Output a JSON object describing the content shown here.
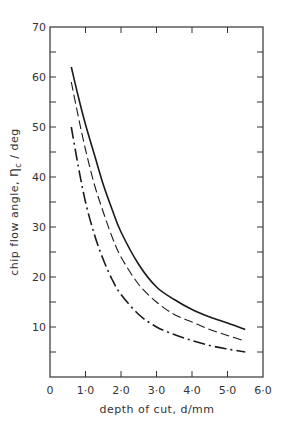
{
  "chart_data": {
    "type": "line",
    "title": "",
    "xlabel": "depth of cut, d/mm",
    "ylabel": "chip flow angle, ηc / deg",
    "ylabel_parts": {
      "prefix": "chip flow angle, ",
      "symbol": "η",
      "subscript": "c",
      "suffix": " / deg"
    },
    "xlim": [
      0,
      6.0
    ],
    "ylim": [
      0,
      70
    ],
    "x_ticks": [
      "0",
      "1·0",
      "2·0",
      "3·0",
      "4·0",
      "5·0",
      "6·0"
    ],
    "y_ticks": [
      "10",
      "20",
      "30",
      "40",
      "50",
      "60",
      "70"
    ],
    "grid": false,
    "legend": null,
    "series": [
      {
        "name": "solid",
        "style": "solid",
        "x": [
          0.6,
          0.8,
          1.0,
          1.25,
          1.5,
          1.75,
          2.0,
          2.5,
          3.0,
          3.5,
          4.0,
          4.5,
          5.0,
          5.5
        ],
        "y": [
          62,
          56,
          50.5,
          44.5,
          38.5,
          33.5,
          29,
          22.5,
          18,
          15.5,
          13.5,
          12,
          10.8,
          9.5
        ]
      },
      {
        "name": "dashed",
        "style": "dashed",
        "x": [
          0.6,
          0.8,
          1.0,
          1.25,
          1.5,
          1.75,
          2.0,
          2.5,
          3.0,
          3.5,
          4.0,
          4.5,
          5.0,
          5.5
        ],
        "y": [
          59,
          52,
          45.5,
          38.5,
          33,
          28,
          24,
          18.5,
          15,
          12.5,
          11,
          9.5,
          8.3,
          7.2
        ]
      },
      {
        "name": "dash-dot",
        "style": "dashdot",
        "x": [
          0.6,
          0.8,
          1.0,
          1.25,
          1.5,
          1.75,
          2.0,
          2.5,
          3.0,
          3.5,
          4.0,
          4.5,
          5.0,
          5.5
        ],
        "y": [
          50,
          42,
          35,
          28.5,
          23.5,
          19.5,
          16.5,
          12.5,
          10,
          8.5,
          7.3,
          6.3,
          5.6,
          5
        ]
      }
    ]
  }
}
